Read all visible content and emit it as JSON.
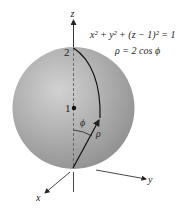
{
  "figure": {
    "equation_sphere": "x² + y² + (z − 1)² = 1",
    "equation_polar": "ρ = 2 cos ϕ",
    "axis_labels": {
      "x": "x",
      "y": "y",
      "z": "z"
    },
    "tick_labels": {
      "top": "2",
      "center": "1"
    },
    "angle_label": "ϕ",
    "radius_label": "ρ"
  },
  "colors": {
    "sphere_light": "#cfcfcf",
    "sphere_mid": "#a9a9a9",
    "sphere_dark": "#8a8a8a",
    "ink": "#222222"
  }
}
